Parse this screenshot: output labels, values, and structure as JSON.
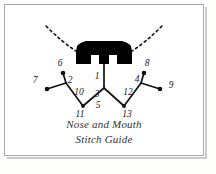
{
  "page": {
    "background_color": "#fdfdfc",
    "frame_color": "#a9a9a9"
  },
  "caption": {
    "line_1": "Nose and Mouth",
    "line_2": "Stitch Guide"
  },
  "diagram": {
    "title": "Nose and Mouth Stitch Guide",
    "ink_color": "#111111",
    "nose": {
      "shape": "rounded-trapezoid-with-two-notches",
      "fill": "#000000"
    },
    "whiskers": {
      "style": "dashed",
      "left_label": "left-whisker",
      "right_label": "right-whisker"
    },
    "stitch_points": [
      {
        "label": "1",
        "x": 97,
        "y": 72
      },
      {
        "label": "2",
        "x": 57,
        "y": 76
      },
      {
        "label": "3",
        "x": 95,
        "y": 90
      },
      {
        "label": "4",
        "x": 140,
        "y": 77
      },
      {
        "label": "5",
        "x": 96,
        "y": 100
      },
      {
        "label": "6",
        "x": 56,
        "y": 63
      },
      {
        "label": "7",
        "x": 32,
        "y": 75
      },
      {
        "label": "8",
        "x": 143,
        "y": 63
      },
      {
        "label": "9",
        "x": 166,
        "y": 79
      },
      {
        "label": "10",
        "x": 72,
        "y": 88
      },
      {
        "label": "11",
        "x": 73,
        "y": 107
      },
      {
        "label": "12",
        "x": 123,
        "y": 88
      },
      {
        "label": "13",
        "x": 124,
        "y": 106
      }
    ]
  }
}
